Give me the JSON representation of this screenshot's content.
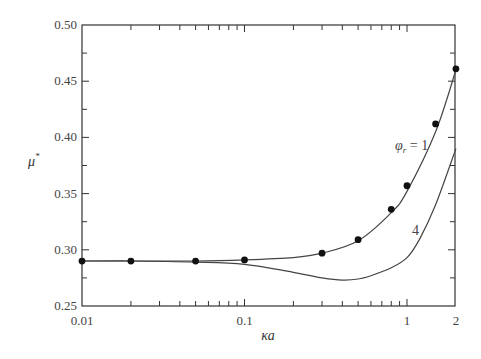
{
  "chart_data": {
    "type": "line",
    "title": "",
    "xlabel": "κa",
    "ylabel": "μ*",
    "xscale": "log",
    "xlim": [
      0.01,
      2
    ],
    "ylim": [
      0.25,
      0.5
    ],
    "xticks": [
      {
        "value": 0.01,
        "label": "0.01"
      },
      {
        "value": 0.1,
        "label": "0.1"
      },
      {
        "value": 1,
        "label": "1"
      },
      {
        "value": 2,
        "label": "2"
      }
    ],
    "yticks": [
      {
        "value": 0.25,
        "label": "0.25"
      },
      {
        "value": 0.3,
        "label": "0.30"
      },
      {
        "value": 0.35,
        "label": "0.35"
      },
      {
        "value": 0.4,
        "label": "0.40"
      },
      {
        "value": 0.45,
        "label": "0.45"
      },
      {
        "value": 0.5,
        "label": "0.50"
      }
    ],
    "grid": false,
    "legend": "none (inline annotations)",
    "series": [
      {
        "name": "φr = 1 (curve)",
        "label": "φ_r = 1",
        "style": "line",
        "x": [
          0.01,
          0.02,
          0.05,
          0.1,
          0.2,
          0.3,
          0.5,
          0.8,
          1.0,
          1.5,
          2.0
        ],
        "y": [
          0.29,
          0.29,
          0.29,
          0.291,
          0.293,
          0.297,
          0.308,
          0.333,
          0.352,
          0.405,
          0.46
        ]
      },
      {
        "name": "φr = 1 (data points)",
        "style": "markers",
        "x": [
          0.01,
          0.02,
          0.05,
          0.1,
          0.3,
          0.5,
          0.8,
          1.0,
          1.5,
          2.0
        ],
        "y": [
          0.29,
          0.29,
          0.29,
          0.291,
          0.297,
          0.309,
          0.336,
          0.357,
          0.412,
          0.461
        ]
      },
      {
        "name": "φr = 4 (curve)",
        "label": "4",
        "style": "line",
        "x": [
          0.01,
          0.02,
          0.05,
          0.1,
          0.2,
          0.3,
          0.4,
          0.5,
          0.6,
          0.8,
          1.0,
          1.2,
          1.5,
          2.0
        ],
        "y": [
          0.29,
          0.29,
          0.289,
          0.287,
          0.28,
          0.275,
          0.273,
          0.274,
          0.277,
          0.284,
          0.293,
          0.31,
          0.34,
          0.39
        ]
      }
    ],
    "annotations": [
      {
        "text": "φ_r = 1",
        "near": {
          "x": 0.85,
          "y": 0.375
        }
      },
      {
        "text": "4",
        "near": {
          "x": 0.85,
          "y": 0.315
        }
      }
    ]
  },
  "labels": {
    "xlabel": "κa",
    "ylabel_main": "μ",
    "ylabel_sup": "*",
    "annot1_phi": "φ",
    "annot1_sub": "r",
    "annot1_eq": " = 1",
    "annot2": "4"
  }
}
